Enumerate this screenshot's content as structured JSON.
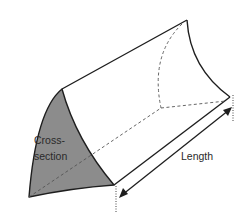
{
  "diagram": {
    "labels": {
      "cross_section_line1": "Cross-",
      "cross_section_line2": "section",
      "length": "Length"
    },
    "colors": {
      "cross_section_fill": "#8c8c8c",
      "outline": "#1e1e1e",
      "hidden_lines": "#555555",
      "background": "#ffffff"
    },
    "annotations": {
      "length_dimension": "double-headed arrow along bottom edge with dotted extension lines"
    }
  }
}
